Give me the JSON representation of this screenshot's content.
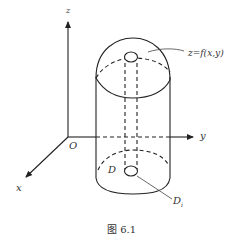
{
  "figure": {
    "caption": "图 6.1",
    "axes": {
      "z_label": "z",
      "y_label": "y",
      "x_label": "x",
      "origin_label": "O"
    },
    "labels": {
      "surface": "z=f(x,y)",
      "region": "D",
      "subregion": "D",
      "subregion_subscript": "i"
    },
    "colors": {
      "stroke": "#222222",
      "text": "#333333",
      "background": "#ffffff"
    }
  }
}
